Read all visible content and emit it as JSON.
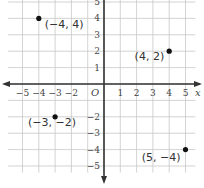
{
  "chart_data": {
    "type": "scatter",
    "title": "",
    "xlabel": "x",
    "ylabel": "",
    "xlim": [
      -5,
      5
    ],
    "ylim": [
      -5,
      5
    ],
    "grid": true,
    "origin_label": "O",
    "x_ticks": [
      "-5",
      "-4",
      "-3",
      "-2",
      "1",
      "2",
      "3",
      "4",
      "5"
    ],
    "y_ticks": [
      "5",
      "4",
      "3",
      "2",
      "1",
      "-2",
      "-3",
      "-4",
      "-5"
    ],
    "points": [
      {
        "x": -4,
        "y": 4,
        "label": "(−4, 4)"
      },
      {
        "x": 4,
        "y": 2,
        "label": "(4, 2)"
      },
      {
        "x": -3,
        "y": -2,
        "label": "(−3, −2)"
      },
      {
        "x": 5,
        "y": -4,
        "label": "(5, −4)"
      }
    ]
  }
}
